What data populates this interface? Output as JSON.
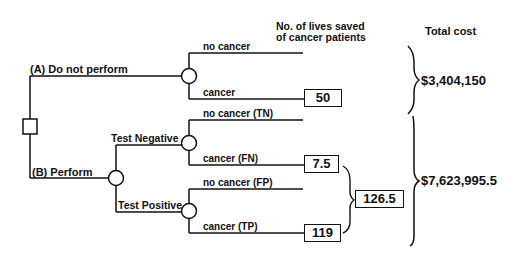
{
  "headers": {
    "lives_line1": "No. of lives saved",
    "lives_line2": "of cancer patients",
    "total_cost": "Total cost"
  },
  "decision": {
    "option_a": "(A) Do not perform",
    "option_b": "(B) Perform"
  },
  "branches": {
    "a_no_cancer": "no cancer",
    "a_cancer": "cancer",
    "test_negative": "Test Negative",
    "test_positive": "Test Positive",
    "tn": "no cancer (TN)",
    "fn": "cancer (FN)",
    "fp": "no cancer (FP)",
    "tp": "cancer (TP)"
  },
  "values": {
    "a_cancer_lives": "50",
    "fn_lives": "7.5",
    "tp_lives": "119",
    "b_total_lives": "126.5"
  },
  "costs": {
    "option_a": "$3,404,150",
    "option_b": "$7,623,995.5"
  },
  "colors": {
    "ink": "#111111",
    "background": "#ffffff"
  }
}
